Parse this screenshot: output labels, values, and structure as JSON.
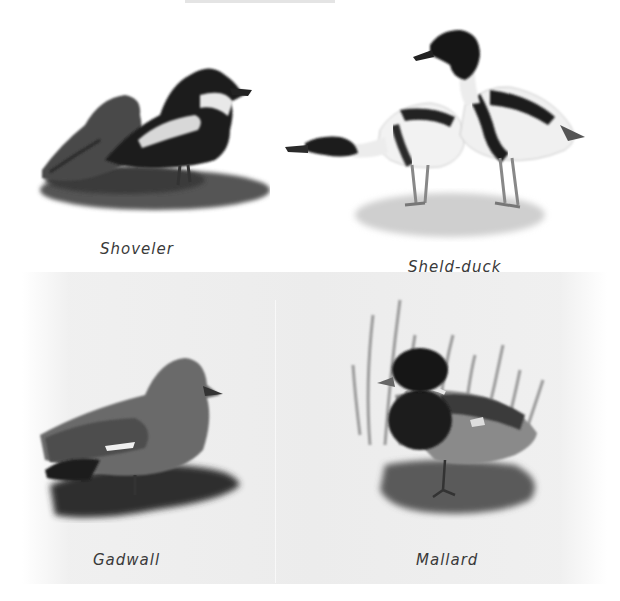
{
  "plate": {
    "background_color": "#ffffff",
    "paper_color": "#ececec",
    "panels": [
      {
        "id": "shoveler",
        "caption": "Shoveler",
        "caption_pos": [
          100,
          240
        ]
      },
      {
        "id": "shelduck",
        "caption": "Sheld-duck",
        "caption_pos": [
          408,
          258
        ]
      },
      {
        "id": "gadwall",
        "caption": "Gadwall",
        "caption_pos": [
          93,
          551
        ]
      },
      {
        "id": "mallard",
        "caption": "Mallard",
        "caption_pos": [
          416,
          551
        ]
      }
    ]
  }
}
